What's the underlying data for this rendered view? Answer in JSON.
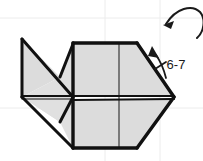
{
  "diagram": {
    "kind": "origami-folding-step",
    "palette": {
      "paper_fill": "#dcdcdc",
      "paper_fill_light": "#e4e4e4",
      "crease_line": "#1a1a1a",
      "outline": "#111111",
      "grid_line": "#ececec",
      "background": "#ffffff",
      "label_color": "#1a1a1a"
    },
    "annotations": {
      "step_label": {
        "name": "repeat-steps-label",
        "text": "6-7",
        "x": 176,
        "y": 66
      },
      "repeat_arrow": {
        "name": "repeat-arrow",
        "description": "up-left arrow with cross tick indicating repeat steps 6-7"
      },
      "rotate_arrow": {
        "name": "rotate-arrow",
        "description": "curved turn-over arrow at top right, partially cropped"
      }
    },
    "grid": {
      "visible": true,
      "vertical_x": [
        105,
        160
      ],
      "horizontal_y": [
        18,
        108
      ]
    },
    "geometry": {
      "center_point": [
        73,
        97
      ],
      "left_tip": [
        22,
        39
      ],
      "right_tip": [
        174,
        97
      ],
      "top_edge_y": 44,
      "bottom_edge_y": 148
    }
  }
}
